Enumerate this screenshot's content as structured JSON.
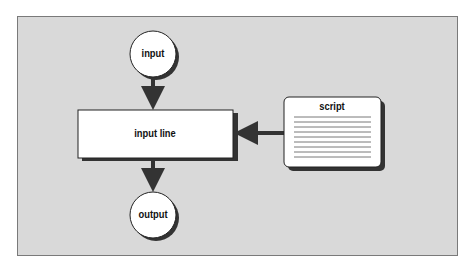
{
  "diagram": {
    "type": "flowchart",
    "nodes": {
      "input": {
        "label": "input",
        "shape": "circle"
      },
      "input_line": {
        "label": "input line",
        "shape": "rectangle"
      },
      "script": {
        "label": "script",
        "shape": "document"
      },
      "output": {
        "label": "output",
        "shape": "circle"
      }
    },
    "edges": [
      {
        "from": "input",
        "to": "input line"
      },
      {
        "from": "script",
        "to": "input line"
      },
      {
        "from": "input line",
        "to": "output"
      }
    ],
    "colors": {
      "panel": "#d9d9d9",
      "node_fill": "#ffffff",
      "stroke": "#222222",
      "shadow": "#333333"
    }
  }
}
